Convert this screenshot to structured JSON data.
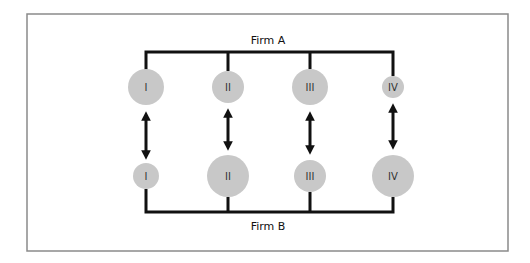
{
  "diagram": {
    "frame": {
      "x": 27,
      "y": 14,
      "width": 481,
      "height": 237,
      "stroke": "#8a8a8a"
    },
    "firm_a": {
      "label": "Firm A",
      "bar_y": 52,
      "units": [
        {
          "label": "I",
          "x": 146,
          "cy": 87,
          "r": 18
        },
        {
          "label": "II",
          "x": 228,
          "cy": 87,
          "r": 16
        },
        {
          "label": "III",
          "x": 310,
          "cy": 87,
          "r": 18
        },
        {
          "label": "IV",
          "x": 393,
          "cy": 87,
          "r": 11
        }
      ]
    },
    "firm_b": {
      "label": "Firm B",
      "bar_y": 212,
      "units": [
        {
          "label": "I",
          "x": 146,
          "cy": 176,
          "r": 13
        },
        {
          "label": "II",
          "x": 228,
          "cy": 176,
          "r": 21
        },
        {
          "label": "III",
          "x": 310,
          "cy": 176,
          "r": 16
        },
        {
          "label": "IV",
          "x": 393,
          "cy": 176,
          "r": 21
        }
      ]
    },
    "links": [
      {
        "from": "Firm A I",
        "to": "Firm B I",
        "type": "bidirectional",
        "y1": 114,
        "y2": 157
      },
      {
        "from": "Firm A II",
        "to": "Firm B II",
        "type": "bidirectional",
        "y1": 112,
        "y2": 148
      },
      {
        "from": "Firm A III",
        "to": "Firm B III",
        "type": "bidirectional",
        "y1": 114,
        "y2": 152
      },
      {
        "from": "Firm A IV",
        "to": "Firm B IV",
        "type": "bidirectional",
        "y1": 106,
        "y2": 147
      }
    ],
    "colors": {
      "node_fill": "#c8c8c8",
      "line": "#111111",
      "text": "#111111"
    }
  }
}
